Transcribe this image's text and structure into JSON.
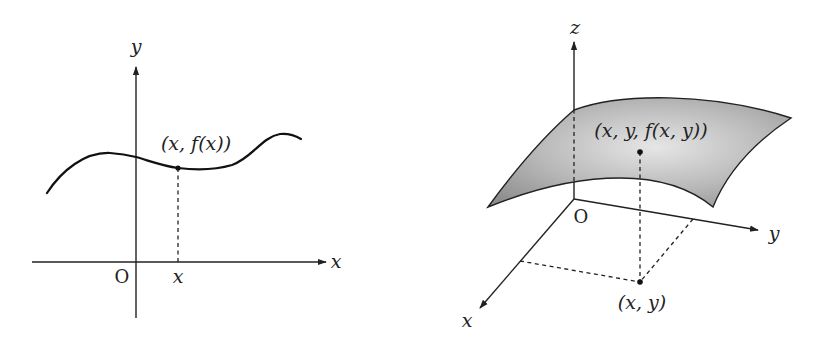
{
  "figure_left": {
    "title": "graph of a function of one variable",
    "axis_x_label": "x",
    "axis_y_label": "y",
    "origin_label": "O",
    "tick_label": "x",
    "point_label": "(x, f(x))"
  },
  "figure_right": {
    "title": "graph of a function of two variables",
    "axis_x_label": "x",
    "axis_y_label": "y",
    "axis_z_label": "z",
    "origin_label": "O",
    "surface_point_label": "(x, y, f(x, y))",
    "base_point_label": "(x, y)",
    "surface_fill": "#a9a9a9"
  }
}
